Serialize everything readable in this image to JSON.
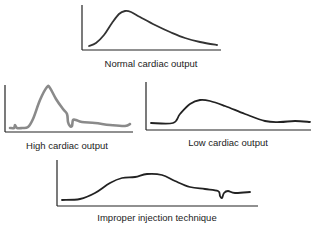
{
  "chart_data": [
    {
      "type": "line",
      "title": "Normal cardiac output",
      "description": "Smooth thermodilution curve: rapid upstroke to a single peak, then gradual exponential decay to baseline",
      "axes": {
        "x": [
          82,
          221
        ],
        "y_top": 5,
        "y_base": 50
      },
      "stroke": "#333333",
      "points": [
        [
          89,
          46
        ],
        [
          96,
          43
        ],
        [
          104,
          35
        ],
        [
          112,
          23
        ],
        [
          119,
          14
        ],
        [
          125,
          11
        ],
        [
          131,
          12
        ],
        [
          140,
          17
        ],
        [
          155,
          25
        ],
        [
          170,
          32
        ],
        [
          185,
          38
        ],
        [
          200,
          42
        ],
        [
          217,
          45
        ]
      ]
    },
    {
      "type": "line",
      "title": "High cardiac output",
      "description": "Tall narrow curve with rapid rise and fall, small notch then flat tail near baseline",
      "axes": {
        "x": [
          5,
          133
        ],
        "y_top": 85,
        "y_base": 132
      },
      "stroke": "#8a8a8a",
      "points": [
        [
          10,
          128
        ],
        [
          14,
          128
        ],
        [
          15,
          125
        ],
        [
          17,
          128
        ],
        [
          22,
          128
        ],
        [
          28,
          127
        ],
        [
          33,
          119
        ],
        [
          40,
          100
        ],
        [
          47,
          87
        ],
        [
          50,
          88
        ],
        [
          56,
          99
        ],
        [
          63,
          109
        ],
        [
          67,
          114
        ],
        [
          68,
          122
        ],
        [
          70,
          126
        ],
        [
          72,
          126
        ],
        [
          73,
          120
        ],
        [
          76,
          120
        ],
        [
          82,
          122
        ],
        [
          95,
          123
        ],
        [
          110,
          125
        ],
        [
          125,
          126
        ],
        [
          130,
          124
        ]
      ]
    },
    {
      "type": "line",
      "title": "Low cardiac output",
      "description": "Low, broad curve with delayed rise, rounded plateau and slow return to baseline",
      "axes": {
        "x": [
          146,
          311
        ],
        "y_top": 82,
        "y_base": 130
      },
      "stroke": "#222222",
      "points": [
        [
          151,
          123
        ],
        [
          173,
          123
        ],
        [
          180,
          114
        ],
        [
          190,
          104
        ],
        [
          200,
          100
        ],
        [
          210,
          101
        ],
        [
          225,
          106
        ],
        [
          245,
          114
        ],
        [
          265,
          121
        ],
        [
          280,
          122
        ],
        [
          295,
          121
        ],
        [
          310,
          122
        ]
      ]
    },
    {
      "type": "line",
      "title": "Improper injection technique",
      "description": "Irregular, uneven curve with a slow lumpy rise, wide plateau and a sharp downward spike near the end",
      "axes": {
        "x": [
          57,
          258
        ],
        "y_top": 160,
        "y_base": 206
      },
      "stroke": "#222222",
      "points": [
        [
          62,
          200
        ],
        [
          80,
          199
        ],
        [
          95,
          193
        ],
        [
          110,
          183
        ],
        [
          122,
          178
        ],
        [
          135,
          177
        ],
        [
          147,
          174
        ],
        [
          162,
          175
        ],
        [
          175,
          181
        ],
        [
          190,
          187
        ],
        [
          205,
          189
        ],
        [
          218,
          191
        ],
        [
          220,
          196
        ],
        [
          222,
          198
        ],
        [
          224,
          193
        ],
        [
          228,
          191
        ],
        [
          235,
          193
        ],
        [
          250,
          192
        ]
      ]
    }
  ],
  "captions": {
    "normal": "Normal cardiac output",
    "high": "High cardiac output",
    "low": "Low cardiac output",
    "improper": "Improper injection technique"
  }
}
